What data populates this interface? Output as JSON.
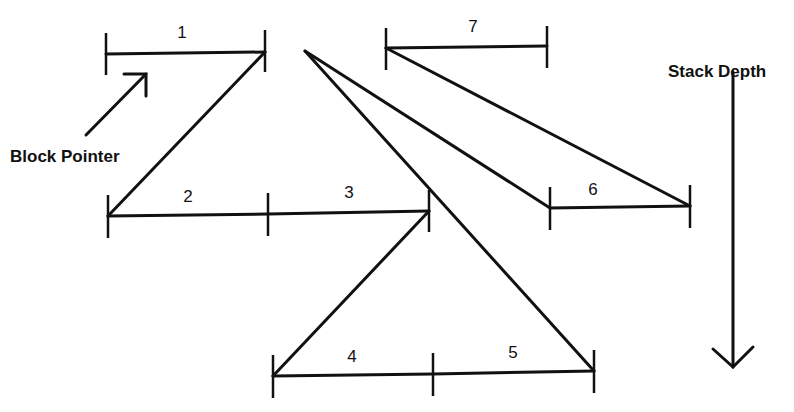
{
  "labels": {
    "block_pointer": "Block Pointer",
    "stack_depth": "Stack Depth"
  },
  "blocks": [
    {
      "id": "1",
      "label": "1"
    },
    {
      "id": "2",
      "label": "2"
    },
    {
      "id": "3",
      "label": "3"
    },
    {
      "id": "4",
      "label": "4"
    },
    {
      "id": "5",
      "label": "5"
    },
    {
      "id": "6",
      "label": "6"
    },
    {
      "id": "7",
      "label": "7"
    }
  ],
  "colors": {
    "ink": "#111111",
    "background": "#ffffff"
  }
}
